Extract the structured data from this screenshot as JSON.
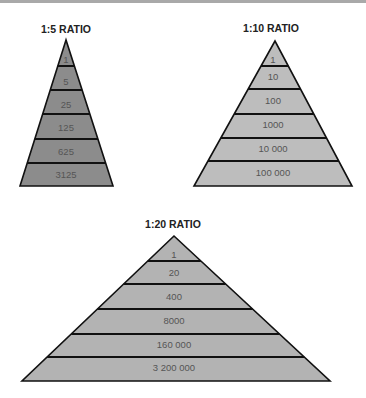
{
  "pyramids": [
    {
      "title": "1:5 RATIO",
      "fill": "#8c8c8c",
      "levels": [
        "1",
        "5",
        "25",
        "125",
        "625",
        "3125"
      ]
    },
    {
      "title": "1:10 RATIO",
      "fill": "#bdbdbd",
      "levels": [
        "1",
        "10",
        "100",
        "1000",
        "10 000",
        "100 000"
      ]
    },
    {
      "title": "1:20 RATIO",
      "fill": "#b3b3b3",
      "levels": [
        "1",
        "20",
        "400",
        "8000",
        "160 000",
        "3 200 000"
      ]
    }
  ],
  "colors": {
    "outline": "#111111",
    "background": "#ffffff"
  }
}
